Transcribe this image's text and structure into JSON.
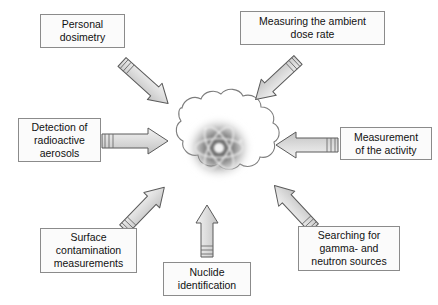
{
  "diagram": {
    "center": {
      "icon": "radioactive-atom-cloud",
      "atom_label": "atom-symbol",
      "cloud_label": "radiation-cloud"
    },
    "colors": {
      "box_border": "#8b8b8b",
      "box_fill": "#fbfbfb",
      "arrow_fill": "#d9d9d9",
      "arrow_stroke": "#555555",
      "text": "#111111",
      "background": "#ffffff",
      "halo": "#555555"
    },
    "nodes": [
      {
        "id": "personal-dosimetry",
        "label": "Personal\ndosimetry",
        "position": "top-left"
      },
      {
        "id": "ambient-dose-rate",
        "label": "Measuring the ambient\ndose rate",
        "position": "top-right"
      },
      {
        "id": "aerosols",
        "label": "Detection of\nradioactive\naerosols",
        "position": "left"
      },
      {
        "id": "activity",
        "label": "Measurement\nof the activity",
        "position": "right"
      },
      {
        "id": "surface-contamination",
        "label": "Surface\ncontamination\nmeasurements",
        "position": "bottom-left"
      },
      {
        "id": "nuclide-identification",
        "label": "Nuclide\nidentification",
        "position": "bottom"
      },
      {
        "id": "gamma-neutron",
        "label": "Searching for\ngamma- and\nneutron sources",
        "position": "bottom-right"
      }
    ],
    "arrows": [
      {
        "id": "arrow-personal-dosimetry",
        "from": "personal-dosimetry",
        "to": "center",
        "direction": "down-right"
      },
      {
        "id": "arrow-ambient-dose-rate",
        "from": "ambient-dose-rate",
        "to": "center",
        "direction": "down-left"
      },
      {
        "id": "arrow-aerosols",
        "from": "aerosols",
        "to": "center",
        "direction": "right"
      },
      {
        "id": "arrow-activity",
        "from": "activity",
        "to": "center",
        "direction": "left"
      },
      {
        "id": "arrow-surface-contamination",
        "from": "surface-contamination",
        "to": "center",
        "direction": "up-right"
      },
      {
        "id": "arrow-nuclide-identification",
        "from": "nuclide-identification",
        "to": "center",
        "direction": "up"
      },
      {
        "id": "arrow-gamma-neutron",
        "from": "gamma-neutron",
        "to": "center",
        "direction": "up-left"
      }
    ]
  }
}
